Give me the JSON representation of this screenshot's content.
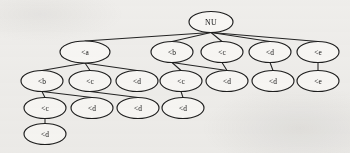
{
  "figure": {
    "type": "tree-diagram",
    "title": "",
    "background_color": "#f2f1ef",
    "node_fill_color": "#fbfaf8",
    "node_stroke_color": "#1d1d1d",
    "edge_color": "#232323",
    "width": 350,
    "height": 153
  },
  "tree": {
    "root_label": "NU",
    "depth": 5,
    "node_count": 18,
    "rows": [
      {
        "index": 0,
        "y": 22,
        "nodes": [
          {
            "id": "n0",
            "label": "NU",
            "x": 211,
            "rx": 22,
            "ry": 10.5
          }
        ]
      },
      {
        "index": 1,
        "y": 52,
        "nodes": [
          {
            "id": "n1",
            "label": "<a",
            "x": 85,
            "rx": 25,
            "ry": 11
          },
          {
            "id": "n2",
            "label": "<b",
            "x": 172,
            "rx": 21,
            "ry": 10.5
          },
          {
            "id": "n3",
            "label": "<c",
            "x": 222,
            "rx": 21,
            "ry": 10.5
          },
          {
            "id": "n4",
            "label": "<d",
            "x": 270,
            "rx": 21,
            "ry": 10.5
          },
          {
            "id": "n5",
            "label": "<e",
            "x": 318,
            "rx": 21,
            "ry": 10.5
          }
        ]
      },
      {
        "index": 2,
        "y": 81,
        "nodes": [
          {
            "id": "n6",
            "label": "<b",
            "x": 42,
            "rx": 21,
            "ry": 10.5
          },
          {
            "id": "n7",
            "label": "<c",
            "x": 90,
            "rx": 21,
            "ry": 10.5
          },
          {
            "id": "n8",
            "label": "<d",
            "x": 137,
            "rx": 21,
            "ry": 10.5
          },
          {
            "id": "n9",
            "label": "<c",
            "x": 181,
            "rx": 21,
            "ry": 10.5
          },
          {
            "id": "n10",
            "label": "<d",
            "x": 227,
            "rx": 21,
            "ry": 10.5
          },
          {
            "id": "n11",
            "label": "<d",
            "x": 273,
            "rx": 21,
            "ry": 10.5
          },
          {
            "id": "n12",
            "label": "<e",
            "x": 318,
            "rx": 21,
            "ry": 10.5
          }
        ]
      },
      {
        "index": 3,
        "y": 108,
        "nodes": [
          {
            "id": "n13",
            "label": "<c",
            "x": 45,
            "rx": 21,
            "ry": 10.5
          },
          {
            "id": "n14",
            "label": "<d",
            "x": 92,
            "rx": 21,
            "ry": 10.5
          },
          {
            "id": "n15",
            "label": "<d",
            "x": 138,
            "rx": 21,
            "ry": 10.5
          },
          {
            "id": "n16",
            "label": "<d",
            "x": 183,
            "rx": 21,
            "ry": 10.5
          }
        ]
      },
      {
        "index": 4,
        "y": 134,
        "nodes": [
          {
            "id": "n17",
            "label": "<d",
            "x": 45,
            "rx": 21,
            "ry": 10.5
          }
        ]
      }
    ],
    "edges": [
      {
        "from": "n0",
        "to": "n1"
      },
      {
        "from": "n0",
        "to": "n2"
      },
      {
        "from": "n0",
        "to": "n3"
      },
      {
        "from": "n0",
        "to": "n4"
      },
      {
        "from": "n0",
        "to": "n5"
      },
      {
        "from": "n1",
        "to": "n6"
      },
      {
        "from": "n1",
        "to": "n7"
      },
      {
        "from": "n1",
        "to": "n8"
      },
      {
        "from": "n2",
        "to": "n9"
      },
      {
        "from": "n2",
        "to": "n10"
      },
      {
        "from": "n3",
        "to": "n10"
      },
      {
        "from": "n4",
        "to": "n11"
      },
      {
        "from": "n5",
        "to": "n12"
      },
      {
        "from": "n6",
        "to": "n13"
      },
      {
        "from": "n6",
        "to": "n14"
      },
      {
        "from": "n7",
        "to": "n15"
      },
      {
        "from": "n9",
        "to": "n16"
      },
      {
        "from": "n13",
        "to": "n17"
      }
    ],
    "labels_legend": [
      "NU",
      "<a",
      "<b",
      "<c",
      "<d",
      "<e"
    ]
  }
}
